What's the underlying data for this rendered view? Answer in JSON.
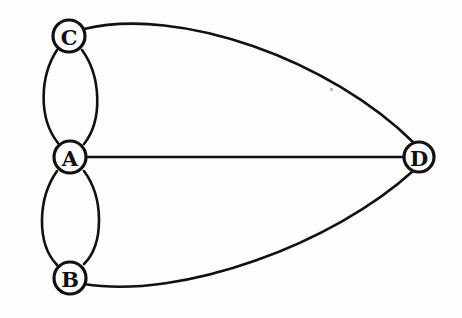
{
  "diagram": {
    "title": "Undirected multigraph with four vertices",
    "type": "graph",
    "background_color": "#fdfdfc",
    "stroke_color": "#111111",
    "node_fill_color": "#ffffff",
    "canvas": {
      "width": 462,
      "height": 318
    },
    "nodes": [
      {
        "id": "A",
        "label": "A",
        "cx": 70,
        "cy": 157,
        "r": 16
      },
      {
        "id": "B",
        "label": "B",
        "cx": 70,
        "cy": 278,
        "r": 16
      },
      {
        "id": "C",
        "label": "C",
        "cx": 69,
        "cy": 36,
        "r": 16
      },
      {
        "id": "D",
        "label": "D",
        "cx": 419,
        "cy": 157,
        "r": 15
      }
    ],
    "edges": [
      {
        "id": "edge-c-a-left",
        "from": "C",
        "to": "A",
        "shape": "arc",
        "bulge": "left",
        "stroke_width": 2.6
      },
      {
        "id": "edge-c-a-right",
        "from": "C",
        "to": "A",
        "shape": "arc",
        "bulge": "right",
        "stroke_width": 2.6
      },
      {
        "id": "edge-a-b-left",
        "from": "A",
        "to": "B",
        "shape": "arc",
        "bulge": "left",
        "stroke_width": 2.6
      },
      {
        "id": "edge-a-b-right",
        "from": "A",
        "to": "B",
        "shape": "arc",
        "bulge": "right",
        "stroke_width": 2.6
      },
      {
        "id": "edge-a-d",
        "from": "A",
        "to": "D",
        "shape": "line",
        "bulge": "none",
        "stroke_width": 2.4
      },
      {
        "id": "edge-c-d",
        "from": "C",
        "to": "D",
        "shape": "arc",
        "bulge": "up",
        "stroke_width": 2.6
      },
      {
        "id": "edge-b-d",
        "from": "B",
        "to": "D",
        "shape": "arc",
        "bulge": "down",
        "stroke_width": 2.6
      }
    ],
    "edge_paths": {
      "edge-c-a-left": "M 57 50 C 40 76 38 118 58 143",
      "edge-c-a-right": "M 82 50 C 101 76 103 120 84 144",
      "edge-a-b-left": "M 57 171 C 38 198 36 243 57 265",
      "edge-a-b-right": "M 84 171 C 104 198 104 244 84 264",
      "edge-a-d": "M 86 157 L 404 157",
      "edge-c-d": "M 84 29 C 180 6 330 60 414 143",
      "edge-b-d": "M 84 284 C 182 300 334 243 413 171"
    },
    "artifact": {
      "name": "scan-speck",
      "x": 330,
      "y": 88,
      "w": 3,
      "h": 3
    }
  }
}
